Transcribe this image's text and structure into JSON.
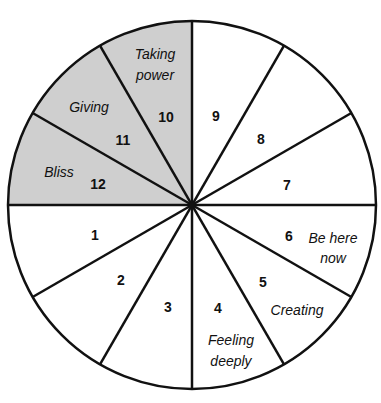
{
  "diagram": {
    "type": "segmented-wheel",
    "center": [
      192,
      205
    ],
    "radius": 184,
    "colors": {
      "shaded": "#cfcfcf",
      "unshaded": "#ffffff",
      "stroke": "#111111"
    },
    "segments": [
      {
        "number": "1",
        "label": "",
        "shaded": false,
        "num_pos": [
          95,
          236
        ],
        "label_lines": []
      },
      {
        "number": "2",
        "label": "",
        "shaded": false,
        "num_pos": [
          121,
          281
        ],
        "label_lines": []
      },
      {
        "number": "3",
        "label": "",
        "shaded": false,
        "num_pos": [
          168,
          308
        ],
        "label_lines": []
      },
      {
        "number": "4",
        "label": "Feeling deeply",
        "shaded": false,
        "num_pos": [
          218,
          309
        ],
        "label_lines": [
          {
            "text": "Feeling",
            "pos": [
              231,
              341
            ]
          },
          {
            "text": "deeply",
            "pos": [
              231,
              362
            ]
          }
        ]
      },
      {
        "number": "5",
        "label": "Creating",
        "shaded": false,
        "num_pos": [
          263,
          283
        ],
        "label_lines": [
          {
            "text": "Creating",
            "pos": [
              297,
              311
            ]
          }
        ]
      },
      {
        "number": "6",
        "label": "Be here now",
        "shaded": false,
        "num_pos": [
          289,
          237
        ],
        "label_lines": [
          {
            "text": "Be here",
            "pos": [
              333,
              239
            ]
          },
          {
            "text": "now",
            "pos": [
              333,
              259
            ]
          }
        ]
      },
      {
        "number": "7",
        "label": "",
        "shaded": false,
        "num_pos": [
          287,
          186
        ],
        "label_lines": []
      },
      {
        "number": "8",
        "label": "",
        "shaded": false,
        "num_pos": [
          261,
          140
        ],
        "label_lines": []
      },
      {
        "number": "9",
        "label": "",
        "shaded": false,
        "num_pos": [
          216,
          117
        ],
        "label_lines": []
      },
      {
        "number": "10",
        "label": "Taking power",
        "shaded": true,
        "num_pos": [
          166,
          118
        ],
        "label_lines": [
          {
            "text": "Taking",
            "pos": [
              155,
              55
            ]
          },
          {
            "text": "power",
            "pos": [
              155,
              76
            ]
          }
        ]
      },
      {
        "number": "11",
        "label": "Giving",
        "shaded": true,
        "num_pos": [
          123,
          141
        ],
        "label_lines": [
          {
            "text": "Giving",
            "pos": [
              89,
              108
            ]
          }
        ]
      },
      {
        "number": "12",
        "label": "Bliss",
        "shaded": true,
        "num_pos": [
          98,
          185
        ],
        "label_lines": [
          {
            "text": "Bliss",
            "pos": [
              59,
              173
            ]
          }
        ]
      }
    ]
  }
}
